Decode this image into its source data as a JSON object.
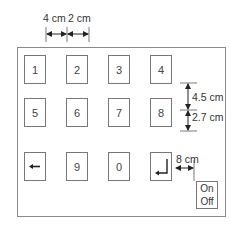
{
  "diagram": {
    "type": "keypad-layout",
    "keys": [
      {
        "label": "1"
      },
      {
        "label": "2"
      },
      {
        "label": "3"
      },
      {
        "label": "4"
      },
      {
        "label": "5"
      },
      {
        "label": "6"
      },
      {
        "label": "7"
      },
      {
        "label": "8"
      },
      {
        "label": "←",
        "icon": "left-arrow-icon"
      },
      {
        "label": "9"
      },
      {
        "label": "0"
      },
      {
        "label": "↵",
        "icon": "enter-icon"
      }
    ],
    "switch": {
      "on_label": "On",
      "off_label": "Off"
    },
    "dimensions": {
      "key_width": "4 cm",
      "key_gap_horizontal": "2 cm",
      "key_height": "4.5 cm",
      "key_gap_vertical": "2.7 cm",
      "switch_offset": "8 cm"
    }
  }
}
